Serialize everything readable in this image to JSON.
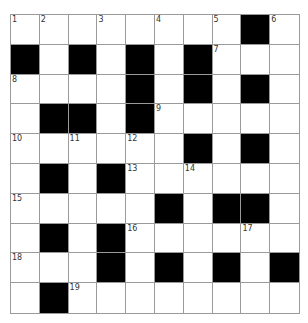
{
  "puzzle": {
    "rows": 10,
    "cols": 10,
    "colors": {
      "grid_line": "#9a9a9a",
      "block": "#000000",
      "cell": "#ffffff",
      "number": "#333333"
    },
    "layout": [
      "........#.",
      "#.#.#.#...",
      "....#.#.#.",
      ".##.#.....",
      "......#.#.",
      ".#.#......",
      ".....#.##.",
      ".#.#......",
      "...#.#.#.#",
      ".#........"
    ],
    "numbers": [
      {
        "row": 0,
        "col": 0,
        "label": "1"
      },
      {
        "row": 0,
        "col": 1,
        "label": "2"
      },
      {
        "row": 0,
        "col": 3,
        "label": "3"
      },
      {
        "row": 0,
        "col": 5,
        "label": "4"
      },
      {
        "row": 0,
        "col": 7,
        "label": "5"
      },
      {
        "row": 0,
        "col": 9,
        "label": "6"
      },
      {
        "row": 1,
        "col": 7,
        "label": "7"
      },
      {
        "row": 2,
        "col": 0,
        "label": "8"
      },
      {
        "row": 3,
        "col": 5,
        "label": "9"
      },
      {
        "row": 4,
        "col": 0,
        "label": "10"
      },
      {
        "row": 4,
        "col": 2,
        "label": "11"
      },
      {
        "row": 4,
        "col": 4,
        "label": "12"
      },
      {
        "row": 5,
        "col": 4,
        "label": "13"
      },
      {
        "row": 5,
        "col": 6,
        "label": "14"
      },
      {
        "row": 6,
        "col": 0,
        "label": "15"
      },
      {
        "row": 7,
        "col": 4,
        "label": "16"
      },
      {
        "row": 7,
        "col": 8,
        "label": "17"
      },
      {
        "row": 8,
        "col": 0,
        "label": "18"
      },
      {
        "row": 9,
        "col": 2,
        "label": "19"
      }
    ],
    "entries": []
  }
}
